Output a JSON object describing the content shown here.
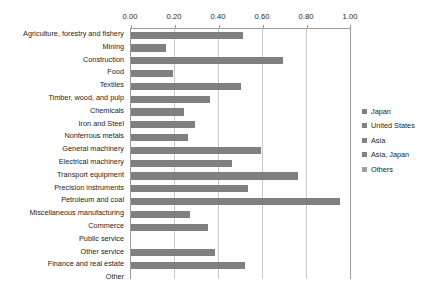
{
  "chart_data": {
    "type": "bar",
    "orientation": "horizontal",
    "title": "",
    "xlabel": "",
    "ylabel": "",
    "xlim": [
      0.0,
      1.0
    ],
    "xticks": [
      "0.00",
      "0.20",
      "0.40",
      "0.60",
      "0.80",
      "1.00"
    ],
    "xtick_values": [
      0.0,
      0.2,
      0.4,
      0.6,
      0.8,
      1.0
    ],
    "grid": true,
    "grid_axis": "x",
    "legend_position": "right",
    "axis_position": "top",
    "bar_color": "#808080",
    "categories": [
      "Agriculture, forestry and fishery",
      "Mining",
      "Construction",
      "Food",
      "Textiles",
      "Timber, wood, and pulp",
      "Chemicals",
      "Iron and Steel",
      "Nonferrous metals",
      "General machinery",
      "Electrical machinery",
      "Transport equipment",
      "Precision instruments",
      "Petroleum and coal",
      "Miscellaneous manufacturing",
      "Commerce",
      "Public service",
      "Other service",
      "Finance and real estate",
      "Other"
    ],
    "values": [
      0.51,
      0.16,
      0.69,
      0.19,
      0.5,
      0.36,
      0.24,
      0.29,
      0.26,
      0.59,
      0.46,
      0.76,
      0.53,
      0.95,
      0.27,
      0.35,
      0.0,
      0.38,
      0.52,
      0.0
    ],
    "legend": [
      {
        "label": "Japan",
        "color": "#808080"
      },
      {
        "label": "United States",
        "color": "#808080"
      },
      {
        "label": "Asia",
        "color": "#808080"
      },
      {
        "label": "Asia, Japan",
        "color": "#808080"
      },
      {
        "label": "Others",
        "color": "#9e9e9e"
      }
    ]
  }
}
